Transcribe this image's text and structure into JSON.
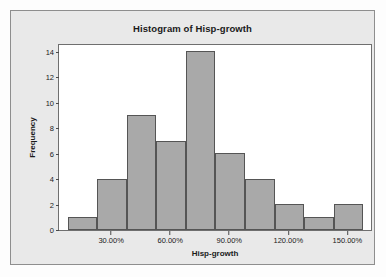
{
  "chart_data": {
    "type": "bar",
    "title": "Histogram of Hisp-growth",
    "xlabel": "Hisp-growth",
    "ylabel": "Frequency",
    "categories": [
      "7.5%-22.5%",
      "22.5%-37.5%",
      "37.5%-52.5%",
      "52.5%-67.5%",
      "67.5%-82.5%",
      "82.5%-97.5%",
      "97.5%-112.5%",
      "112.5%-127.5%",
      "127.5%-142.5%",
      "142.5%-157.5%"
    ],
    "values": [
      1,
      4,
      9,
      7,
      14,
      6,
      4,
      2,
      1,
      2
    ],
    "bin_edges": [
      7.5,
      22.5,
      37.5,
      52.5,
      67.5,
      82.5,
      97.5,
      112.5,
      127.5,
      142.5,
      157.5
    ],
    "xlim": [
      3.0,
      161.5
    ],
    "ylim": [
      0,
      14.5
    ],
    "ytick_values": [
      0,
      2,
      4,
      6,
      8,
      10,
      12,
      14
    ],
    "ytick_labels": [
      "0",
      "2",
      "4",
      "6",
      "8",
      "10",
      "12",
      "14"
    ],
    "xtick_values": [
      30,
      60,
      90,
      120,
      150
    ],
    "xtick_labels": [
      "30.00%",
      "60.00%",
      "90.00%",
      "120.00%",
      "150.00%"
    ],
    "grid": false,
    "legend": null,
    "bar_fill_color": "#a9a9a9",
    "bar_edge_color": "#555555",
    "plot_background": "#ffffff",
    "figure_background": "#e9e9e9"
  }
}
